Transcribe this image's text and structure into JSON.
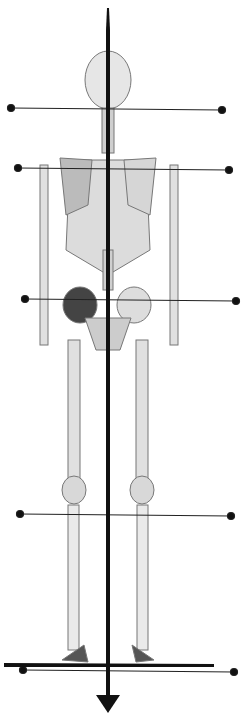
{
  "diagram": {
    "title": "",
    "colors": {
      "line": "#111111",
      "bone_light": "#e8e8e8",
      "bone_dark": "#555555",
      "background": "#ffffff"
    },
    "plumb_line": {
      "x": 108,
      "y_top": 8,
      "y_bottom": 712,
      "arrow": "down"
    },
    "ground_line": {
      "x1": 4,
      "x2": 214,
      "y": 665
    },
    "reference_lines": [
      {
        "name": "head",
        "x1": 11,
        "y1": 108,
        "x2": 222,
        "y2": 110
      },
      {
        "name": "shoulders",
        "x1": 18,
        "y1": 168,
        "x2": 229,
        "y2": 170
      },
      {
        "name": "pelvis",
        "x1": 25,
        "y1": 299,
        "x2": 236,
        "y2": 301
      },
      {
        "name": "knees",
        "x1": 20,
        "y1": 514,
        "x2": 231,
        "y2": 516
      },
      {
        "name": "feet",
        "x1": 23,
        "y1": 670,
        "x2": 234,
        "y2": 672
      }
    ]
  }
}
